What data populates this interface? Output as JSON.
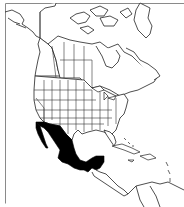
{
  "map": {
    "region": "North America",
    "highlighted_region": "Mexico",
    "colors": {
      "background": "#ffffff",
      "land": "#ffffff",
      "outline": "#222222",
      "highlight": "#000000",
      "frame": "#8a8a8a"
    }
  }
}
